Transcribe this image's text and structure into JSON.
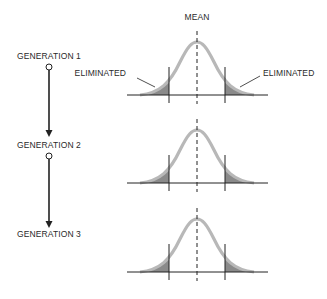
{
  "diagram": {
    "mean_label": "MEAN",
    "eliminated_left_label": "ELIMINATED",
    "eliminated_right_label": "ELIMINATED",
    "generations": [
      {
        "label": "GENERATION 1"
      },
      {
        "label": "GENERATION 2"
      },
      {
        "label": "GENERATION 3"
      }
    ],
    "colors": {
      "curve": "#b8b8b8",
      "tail_fill": "#8a8a8a",
      "line": "#222222"
    }
  }
}
